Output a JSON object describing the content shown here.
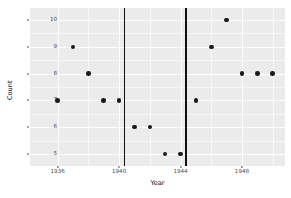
{
  "chart_data": {
    "type": "scatter",
    "title": "",
    "xlabel": "Year",
    "ylabel": "Count",
    "xlim": [
      1934.2,
      1950.8
    ],
    "ylim": [
      4.55,
      10.45
    ],
    "grid": true,
    "legend": null,
    "background_color": "#ebebeb",
    "point_color": "#1a1a1a",
    "reference_line_color": "#111111",
    "xticks": [
      1936,
      1940,
      1944,
      1948
    ],
    "xtick_labels": [
      "1936",
      "1940",
      "1944",
      "1948"
    ],
    "yticks": [
      5,
      6,
      7,
      8,
      9,
      10
    ],
    "ytick_labels": [
      "5",
      "6",
      "7",
      "8",
      "9",
      "10"
    ],
    "reference_lines": [
      {
        "orientation": "vertical",
        "x": 1940.3
      },
      {
        "orientation": "vertical",
        "x": 1944.3
      }
    ],
    "x": [
      1936,
      1937,
      1938,
      1939,
      1940,
      1941,
      1942,
      1943,
      1944,
      1945,
      1946,
      1947,
      1948,
      1949,
      1950,
      1951,
      1952
    ],
    "y": [
      7,
      9,
      8,
      7,
      7,
      6,
      6,
      5,
      5,
      7,
      9,
      10,
      8,
      8,
      8,
      7,
      7
    ],
    "points": [
      {
        "x": 1936.0,
        "y": 7
      },
      {
        "x": 1937.0,
        "y": 9
      },
      {
        "x": 1938.0,
        "y": 8
      },
      {
        "x": 1939.0,
        "y": 7
      },
      {
        "x": 1940.0,
        "y": 7
      },
      {
        "x": 1941.0,
        "y": 6
      },
      {
        "x": 1942.0,
        "y": 6
      },
      {
        "x": 1943.0,
        "y": 5
      },
      {
        "x": 1944.0,
        "y": 5
      },
      {
        "x": 1945.0,
        "y": 7
      },
      {
        "x": 1946.0,
        "y": 9
      },
      {
        "x": 1947.0,
        "y": 10
      },
      {
        "x": 1948.0,
        "y": 8
      },
      {
        "x": 1949.0,
        "y": 8
      },
      {
        "x": 1950.0,
        "y": 8
      },
      {
        "x": 1951.0,
        "y": 7
      }
    ]
  }
}
